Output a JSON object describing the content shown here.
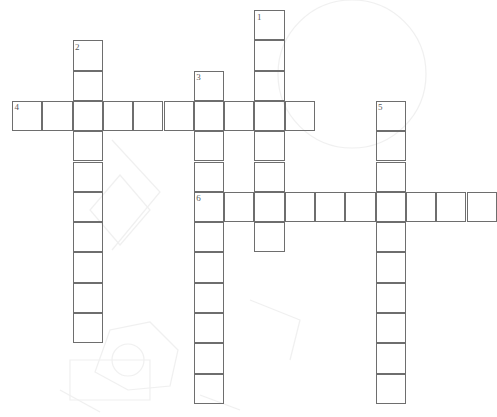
{
  "puzzle": {
    "title": "Crossword Puzzle Grid",
    "grid": {
      "cell_size": 30.3,
      "origin_x": 12,
      "origin_y": 10,
      "columns": 16,
      "rows": 14,
      "cell_border_color": "#6e6e6e",
      "cell_fill_color": "#ffffff",
      "background_color": "#ffffff",
      "number_color": "#5a5a5a"
    },
    "entries": [
      {
        "number": "1",
        "direction": "down",
        "col": 8,
        "row": 0,
        "length": 8,
        "label": "clue-1-down"
      },
      {
        "number": "2",
        "direction": "down",
        "col": 2,
        "row": 1,
        "length": 10,
        "label": "clue-2-down"
      },
      {
        "number": "3",
        "direction": "down",
        "col": 6,
        "row": 2,
        "length": 11,
        "label": "clue-3-down"
      },
      {
        "number": "4",
        "direction": "across",
        "col": 0,
        "row": 3,
        "length": 10,
        "label": "clue-4-across"
      },
      {
        "number": "5",
        "direction": "down",
        "col": 12,
        "row": 3,
        "length": 10,
        "label": "clue-5-down"
      },
      {
        "number": "6",
        "direction": "across",
        "col": 6,
        "row": 6,
        "length": 10,
        "label": "clue-6-across"
      }
    ],
    "numbers_visible": [
      "1",
      "2",
      "3",
      "4",
      "5",
      "6"
    ],
    "letters": []
  }
}
